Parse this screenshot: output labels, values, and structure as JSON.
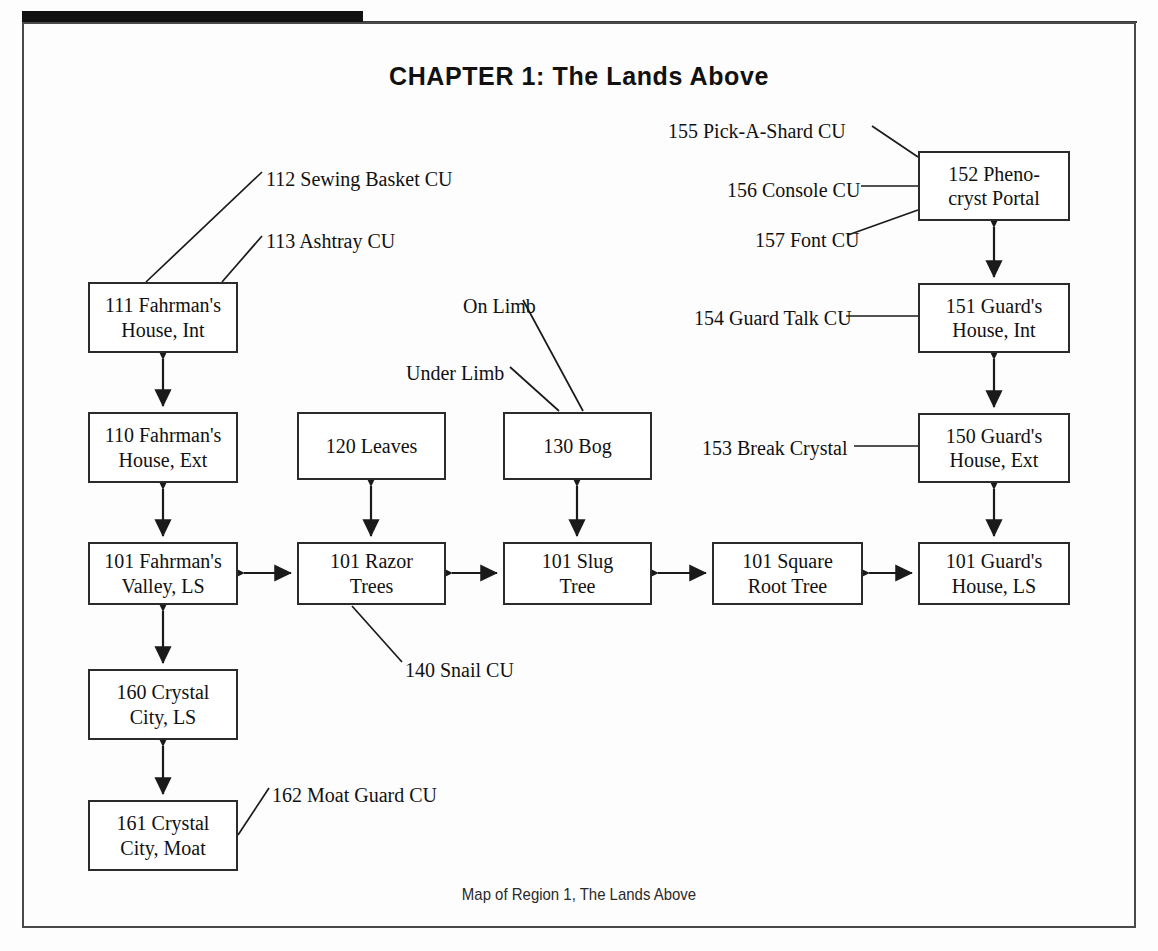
{
  "document": {
    "title": "CHAPTER 1: The Lands Above",
    "caption": "Map of Region 1, The Lands Above"
  },
  "diagram": {
    "type": "flow-map",
    "nodes": [
      {
        "id": "n111",
        "label": "111 Fahrman's\nHouse, Int",
        "line1": "111 Fahrman's",
        "line2": "House, Int",
        "x": 88,
        "y": 282,
        "w": 150,
        "h": 71
      },
      {
        "id": "n110",
        "label": "110 Fahrman's\nHouse, Ext",
        "line1": "110 Fahrman's",
        "line2": "House, Ext",
        "x": 88,
        "y": 412,
        "w": 150,
        "h": 71
      },
      {
        "id": "n101f",
        "label": "101 Fahrman's\nValley, LS",
        "line1": "101 Fahrman's",
        "line2": "Valley, LS",
        "x": 88,
        "y": 542,
        "w": 150,
        "h": 63
      },
      {
        "id": "n160",
        "label": "160 Crystal\nCity, LS",
        "line1": "160 Crystal",
        "line2": "City, LS",
        "x": 88,
        "y": 669,
        "w": 150,
        "h": 71
      },
      {
        "id": "n161",
        "label": "161 Crystal\nCity, Moat",
        "line1": "161 Crystal",
        "line2": "City, Moat",
        "x": 88,
        "y": 800,
        "w": 150,
        "h": 71
      },
      {
        "id": "n120",
        "label": "120 Leaves",
        "line1": "120 Leaves",
        "line2": "",
        "x": 297,
        "y": 412,
        "w": 149,
        "h": 68
      },
      {
        "id": "n101r",
        "label": "101 Razor\nTrees",
        "line1": "101 Razor",
        "line2": "Trees",
        "x": 297,
        "y": 542,
        "w": 149,
        "h": 63
      },
      {
        "id": "n130",
        "label": "130 Bog",
        "line1": "130 Bog",
        "line2": "",
        "x": 503,
        "y": 412,
        "w": 149,
        "h": 68
      },
      {
        "id": "n101s",
        "label": "101 Slug\nTree",
        "line1": "101 Slug",
        "line2": "Tree",
        "x": 503,
        "y": 542,
        "w": 149,
        "h": 63
      },
      {
        "id": "n101q",
        "label": "101 Square\nRoot Tree",
        "line1": "101 Square",
        "line2": "Root Tree",
        "x": 712,
        "y": 542,
        "w": 151,
        "h": 63
      },
      {
        "id": "n152",
        "label": "152 Pheno-\ncryst Portal",
        "line1": "152 Pheno-",
        "line2": "cryst Portal",
        "x": 918,
        "y": 151,
        "w": 152,
        "h": 70
      },
      {
        "id": "n151",
        "label": "151 Guard's\nHouse, Int",
        "line1": "151 Guard's",
        "line2": "House, Int",
        "x": 918,
        "y": 283,
        "w": 152,
        "h": 70
      },
      {
        "id": "n150",
        "label": "150 Guard's\nHouse, Ext",
        "line1": "150 Guard's",
        "line2": "House, Ext",
        "x": 918,
        "y": 413,
        "w": 152,
        "h": 70
      },
      {
        "id": "n101g",
        "label": "101 Guard's\nHouse, LS",
        "line1": "101 Guard's",
        "line2": "House, LS",
        "x": 918,
        "y": 542,
        "w": 152,
        "h": 63
      }
    ],
    "callouts": [
      {
        "id": "c112",
        "text": "112 Sewing Basket CU",
        "x": 266,
        "y": 168,
        "align": "left"
      },
      {
        "id": "c113",
        "text": "113 Ashtray CU",
        "x": 266,
        "y": 230,
        "align": "left"
      },
      {
        "id": "c140",
        "text": "140 Snail CU",
        "x": 405,
        "y": 659,
        "align": "left"
      },
      {
        "id": "c162",
        "text": "162 Moat Guard CU",
        "x": 272,
        "y": 784,
        "align": "left"
      },
      {
        "id": "cOn",
        "text": "On Limb",
        "x": 463,
        "y": 295,
        "align": "left"
      },
      {
        "id": "cUnd",
        "text": "Under Limb",
        "x": 406,
        "y": 362,
        "align": "left"
      },
      {
        "id": "c155",
        "text": "155 Pick-A-Shard CU",
        "x": 668,
        "y": 120,
        "align": "left"
      },
      {
        "id": "c156",
        "text": "156 Console CU",
        "x": 727,
        "y": 179,
        "align": "left"
      },
      {
        "id": "c157",
        "text": "157 Font CU",
        "x": 755,
        "y": 229,
        "align": "left"
      },
      {
        "id": "c154",
        "text": "154 Guard Talk CU",
        "x": 694,
        "y": 307,
        "align": "left"
      },
      {
        "id": "c153",
        "text": "153 Break Crystal",
        "x": 702,
        "y": 437,
        "align": "left"
      }
    ],
    "connections": [
      {
        "from": "n111",
        "to": "n110",
        "kind": "double-arrow",
        "dir": "vertical"
      },
      {
        "from": "n110",
        "to": "n101f",
        "kind": "double-arrow",
        "dir": "vertical"
      },
      {
        "from": "n101f",
        "to": "n160",
        "kind": "double-arrow",
        "dir": "vertical"
      },
      {
        "from": "n160",
        "to": "n161",
        "kind": "double-arrow",
        "dir": "vertical"
      },
      {
        "from": "n120",
        "to": "n101r",
        "kind": "double-arrow",
        "dir": "vertical"
      },
      {
        "from": "n130",
        "to": "n101s",
        "kind": "double-arrow",
        "dir": "vertical"
      },
      {
        "from": "n152",
        "to": "n151",
        "kind": "double-arrow",
        "dir": "vertical"
      },
      {
        "from": "n151",
        "to": "n150",
        "kind": "double-arrow",
        "dir": "vertical"
      },
      {
        "from": "n150",
        "to": "n101g",
        "kind": "double-arrow",
        "dir": "vertical"
      },
      {
        "from": "n101f",
        "to": "n101r",
        "kind": "double-arrow",
        "dir": "horizontal"
      },
      {
        "from": "n101r",
        "to": "n101s",
        "kind": "double-arrow",
        "dir": "horizontal"
      },
      {
        "from": "n101s",
        "to": "n101q",
        "kind": "double-arrow",
        "dir": "horizontal"
      },
      {
        "from": "n101q",
        "to": "n101g",
        "kind": "double-arrow",
        "dir": "horizontal"
      }
    ],
    "colors": {
      "ink": "#111111",
      "box_border": "#2b2b2b",
      "frame": "#4a4a4a",
      "header_bar": "#111111",
      "page": "#fdfdfd"
    }
  }
}
